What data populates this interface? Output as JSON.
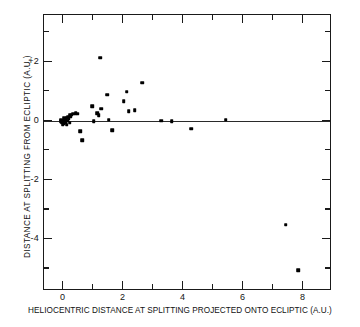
{
  "chart_data": {
    "type": "scatter",
    "title": "",
    "xlabel": "HELIOCENTRIC DISTANCE AT SPLITTING PROJECTED ONTO ECLIPTIC (A.U.)",
    "ylabel": "DISTANCE AT SPLITTING FROM ECLIPTIC (A.U.)",
    "xlim": [
      -0.65,
      8.95
    ],
    "ylim": [
      -5.75,
      3.6
    ],
    "xticks": [
      0,
      2,
      4,
      6,
      8
    ],
    "xtick_labels": [
      "0",
      "2",
      "4",
      "6",
      "8"
    ],
    "xticks_minor": [
      1,
      3,
      5,
      7
    ],
    "yticks": [
      2,
      0,
      -2,
      -4
    ],
    "ytick_labels": [
      "+2",
      "0",
      "-2",
      "-4"
    ],
    "yticks_minor": [
      3,
      1,
      -1,
      -3,
      -5
    ],
    "grid": false,
    "legend": null,
    "reference_line": {
      "type": "horizontal",
      "y": 0
    },
    "marker": "square-dot",
    "marker_color": "#000000",
    "series": [
      {
        "name": "split comets",
        "points": [
          [
            -0.02,
            0.02
          ],
          [
            -0.05,
            -0.05
          ],
          [
            -0.08,
            0.0
          ],
          [
            0.0,
            -0.08
          ],
          [
            0.03,
            0.05
          ],
          [
            0.05,
            -0.03
          ],
          [
            0.02,
            0.1
          ],
          [
            -0.1,
            0.05
          ],
          [
            0.08,
            0.0
          ],
          [
            0.0,
            0.0
          ],
          [
            -0.03,
            -0.1
          ],
          [
            0.06,
            0.08
          ],
          [
            0.1,
            0.12
          ],
          [
            0.12,
            0.02
          ],
          [
            0.15,
            0.15
          ],
          [
            0.18,
            0.1
          ],
          [
            0.2,
            0.2
          ],
          [
            0.24,
            0.18
          ],
          [
            0.28,
            0.22
          ],
          [
            0.33,
            0.25
          ],
          [
            0.4,
            0.27
          ],
          [
            0.47,
            0.26
          ],
          [
            0.1,
            -0.12
          ],
          [
            0.2,
            -0.05
          ],
          [
            0.55,
            -0.33
          ],
          [
            0.62,
            -0.65
          ],
          [
            0.95,
            0.52
          ],
          [
            1.0,
            0.0
          ],
          [
            1.18,
            0.2
          ],
          [
            1.22,
            2.15
          ],
          [
            1.25,
            0.43
          ],
          [
            1.12,
            0.27
          ],
          [
            1.45,
            0.9
          ],
          [
            1.5,
            0.05
          ],
          [
            1.62,
            -0.3
          ],
          [
            2.0,
            0.67
          ],
          [
            2.1,
            1.0
          ],
          [
            2.18,
            0.35
          ],
          [
            2.38,
            0.38
          ],
          [
            2.62,
            1.3
          ],
          [
            3.25,
            0.02
          ],
          [
            3.6,
            0.0
          ],
          [
            4.25,
            -0.25
          ],
          [
            5.4,
            0.05
          ],
          [
            7.4,
            -3.5
          ],
          [
            7.82,
            -5.05
          ]
        ]
      }
    ]
  },
  "axis_titles": {
    "x": "HELIOCENTRIC DISTANCE AT SPLITTING PROJECTED ONTO ECLIPTIC (A.U.)",
    "y": "DISTANCE AT SPLITTING FROM ECLIPTIC (A.U.)"
  }
}
